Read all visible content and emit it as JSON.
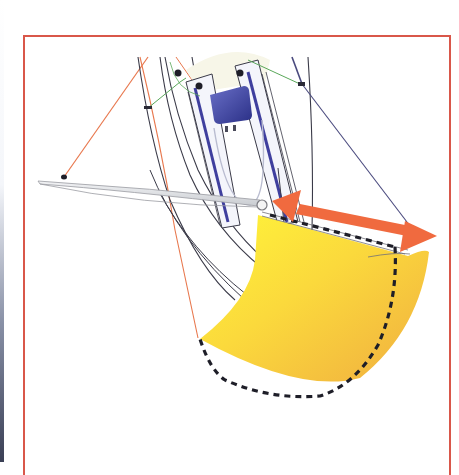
{
  "figure": {
    "type": "sailing-rig-diagram",
    "frame_color": "#d9574a",
    "colors": {
      "sail_light": "#fff23a",
      "sail_dark": "#f2b63e",
      "arrow": "#f06a3f",
      "hull_stripe": "#3f3f9e",
      "cockpit": "#3a3f9c",
      "line_dark": "#3a3a48",
      "line_orange": "#e8784e",
      "line_green": "#5aa85a",
      "line_blue": "#4a4a7e",
      "boom": "#d8dadd",
      "dashed_outline": "#1e1e28"
    },
    "elements": {
      "hull": "boat-hull",
      "boom": "boom",
      "sail": "sail",
      "dashed_outline": "alternative-sail-shape",
      "arrow": "double-headed-adjustment-arrow",
      "shroud_left": "orange-shroud-line",
      "shroud_right": "blue-shroud-line",
      "green_line": "green-control-line"
    }
  }
}
